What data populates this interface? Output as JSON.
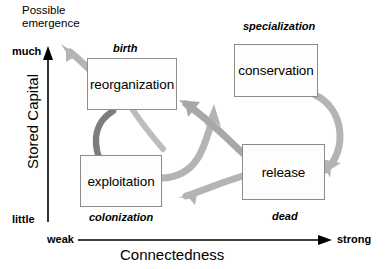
{
  "diagram": {
    "nodes": [
      {
        "id": "reorganization",
        "label": "reorganization"
      },
      {
        "id": "conservation",
        "label": "conservation"
      },
      {
        "id": "exploitation",
        "label": "exploitation"
      },
      {
        "id": "release",
        "label": "release"
      }
    ],
    "phase_labels": {
      "birth": "birth",
      "specialization": "specialization",
      "colonization": "colonization",
      "dead": "dead"
    },
    "annotation": {
      "emergence_line1": "Possible",
      "emergence_line2": "emergence"
    },
    "axes": {
      "y": {
        "title": "Stored Capital",
        "low": "little",
        "high": "much"
      },
      "x": {
        "title": "Connectedness",
        "low": "weak",
        "high": "strong"
      }
    },
    "colors": {
      "arrow_light": "#b0b0b0",
      "arrow_dark": "#808080",
      "box_border": "#8c8c8c",
      "box_fill": "#fdfdfd",
      "axis": "#000000",
      "text": "#000000"
    }
  }
}
